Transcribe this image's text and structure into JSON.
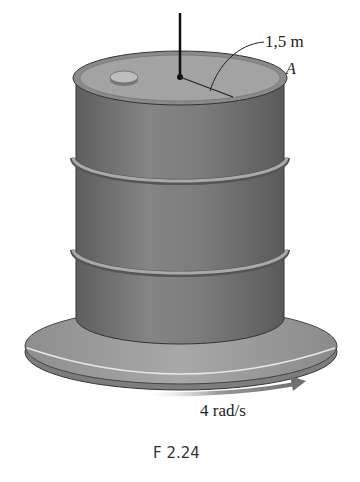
{
  "figure": {
    "caption": "F 2.24",
    "labels": {
      "radius": "1,5 m",
      "point": "A",
      "angular_velocity": "4 rad/s"
    },
    "colors": {
      "drum_body": "#7a7a7a",
      "drum_top": "#9a9a9a",
      "platform": "#9c9c9c",
      "arrow": "#7f7f7f"
    }
  }
}
